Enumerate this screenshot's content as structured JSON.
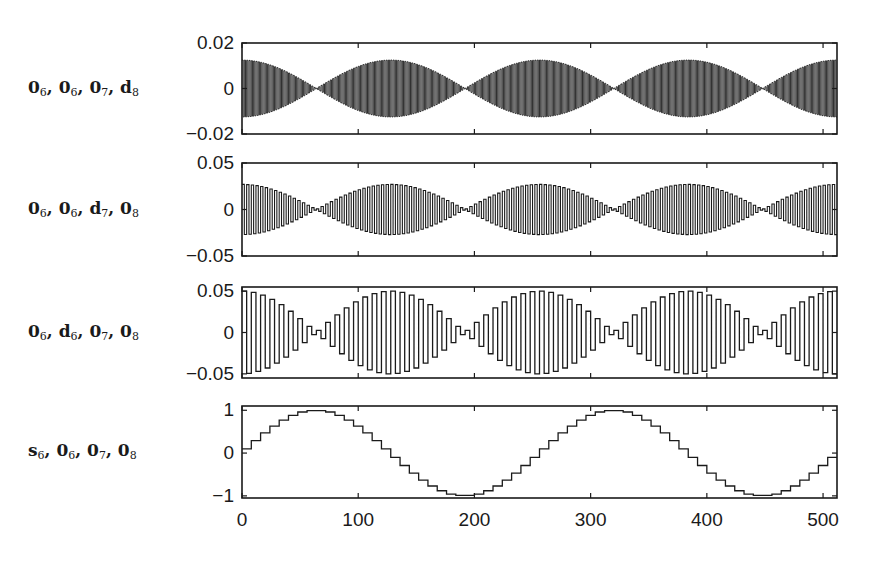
{
  "chart_data": {
    "type": "line",
    "layout": "4 stacked subplots sharing x-axis",
    "xlabel": "",
    "xlim": [
      0,
      512
    ],
    "x_ticks": [
      "0",
      "100",
      "200",
      "300",
      "400",
      "500"
    ],
    "x_tick_values": [
      0,
      100,
      200,
      300,
      400,
      500
    ],
    "grid": false,
    "legend": null,
    "panels": [
      {
        "label_parts": [
          [
            "0",
            "6"
          ],
          [
            "0",
            "6"
          ],
          [
            "0",
            "7"
          ],
          [
            "d",
            "8"
          ]
        ],
        "label_text": "0_6, 0_6, 0_7, d_8",
        "ylim": [
          -0.02,
          0.02
        ],
        "y_ticks": [
          "0.02",
          "0",
          "-0.02"
        ],
        "y_tick_values": [
          0.02,
          0,
          -0.02
        ],
        "signal": "dense oscillation (period 2 samples) with |cos| envelope",
        "amplitude": 0.0125,
        "carrier_half_period": 1,
        "envelope_nodes": [
          64,
          192,
          320,
          448
        ]
      },
      {
        "label_parts": [
          [
            "0",
            "6"
          ],
          [
            "0",
            "6"
          ],
          [
            "d",
            "7"
          ],
          [
            "0",
            "8"
          ]
        ],
        "label_text": "0_6, 0_6, d_7, 0_8",
        "ylim": [
          -0.05,
          0.05
        ],
        "y_ticks": [
          "0.05",
          "0",
          "-0.05"
        ],
        "y_tick_values": [
          0.05,
          0,
          -0.05
        ],
        "signal": "oscillation (period 4 samples) with |cos| envelope",
        "amplitude": 0.027,
        "carrier_half_period": 2,
        "envelope_nodes": [
          64,
          192,
          320,
          448
        ]
      },
      {
        "label_parts": [
          [
            "0",
            "6"
          ],
          [
            "d",
            "6"
          ],
          [
            "0",
            "7"
          ],
          [
            "0",
            "8"
          ]
        ],
        "label_text": "0_6, d_6, 0_7, 0_8",
        "ylim": [
          -0.055,
          0.055
        ],
        "y_ticks": [
          "0.05",
          "0",
          "-0.05"
        ],
        "y_tick_values": [
          0.05,
          0,
          -0.05
        ],
        "signal": "square oscillation (period 8 samples) with |cos| envelope",
        "amplitude": 0.05,
        "carrier_half_period": 4,
        "envelope_nodes": [
          64,
          192,
          320,
          448
        ]
      },
      {
        "label_parts": [
          [
            "s",
            "6"
          ],
          [
            "0",
            "6"
          ],
          [
            "0",
            "7"
          ],
          [
            "0",
            "8"
          ]
        ],
        "label_text": "s_6, 0_6, 0_7, 0_8",
        "ylim": [
          -1.05,
          1.1
        ],
        "y_ticks": [
          "1",
          "0",
          "-1"
        ],
        "y_tick_values": [
          1,
          0,
          -1
        ],
        "signal": "piecewise-constant sine (8-sample steps), period 256",
        "step_width": 8,
        "step_values": [
          0.1,
          0.29,
          0.47,
          0.63,
          0.77,
          0.88,
          0.96,
          0.99,
          0.99,
          0.96,
          0.88,
          0.77,
          0.63,
          0.47,
          0.29,
          0.1,
          -0.1,
          -0.29,
          -0.47,
          -0.63,
          -0.77,
          -0.88,
          -0.96,
          -0.99,
          -0.99,
          -0.96,
          -0.88,
          -0.77,
          -0.63,
          -0.47,
          -0.29,
          -0.1,
          0.1,
          0.29,
          0.47,
          0.63,
          0.77,
          0.88,
          0.96,
          0.99,
          0.99,
          0.96,
          0.88,
          0.77,
          0.63,
          0.47,
          0.29,
          0.1,
          -0.1,
          -0.29,
          -0.47,
          -0.63,
          -0.77,
          -0.88,
          -0.96,
          -0.99,
          -0.99,
          -0.96,
          -0.88,
          -0.77,
          -0.63,
          -0.47,
          -0.29,
          -0.1
        ]
      }
    ]
  },
  "frame": {
    "axis_left_px": 242,
    "axis_right_px": 837,
    "panel_top_px": [
      43,
      163,
      287,
      406
    ],
    "panel_bottom_px": [
      134,
      256,
      378,
      498
    ],
    "ink": "#1a1a1a"
  }
}
